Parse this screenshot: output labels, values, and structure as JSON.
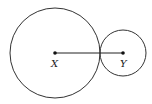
{
  "diagram": {
    "type": "two tangent circles with centers joined by a segment",
    "colors": {
      "stroke": "#333333",
      "background": "#ffffff"
    },
    "circles": [
      {
        "name": "large",
        "center_label": "X",
        "cx": 55,
        "cy": 53,
        "r": 45
      },
      {
        "name": "small",
        "center_label": "Y",
        "cx": 123,
        "cy": 53,
        "r": 23
      }
    ],
    "segment": {
      "from": "X",
      "to": "Y"
    },
    "labels": {
      "x": "X",
      "y": "Y"
    }
  }
}
